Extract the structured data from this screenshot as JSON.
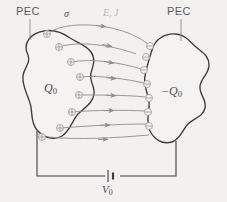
{
  "figure": {
    "kind": "physics-diagram",
    "background_color": "#f2f1ef",
    "ink_color": "#4a4a4a",
    "blob_fill": "#f4f3f1",
    "field_line_color": "#8e8c8a",
    "faded_label_color": "#b9b7b5"
  },
  "labels": {
    "pec_left": "PEC",
    "pec_right": "PEC",
    "charge_left": "Q",
    "charge_left_sub": "0",
    "charge_right": "−Q",
    "charge_right_sub": "0",
    "conductivity": "σ",
    "fields": "E, J",
    "voltage": "V",
    "voltage_sub": "0"
  },
  "symbols": {
    "positive_charge": "⊕",
    "negative_charge": "⊖",
    "battery": "battery-symbol"
  },
  "charges": {
    "positive_count": 8,
    "negative_count": 7
  },
  "field_lines": {
    "count": 7,
    "direction": "left-to-right",
    "arrowheads": true
  },
  "circuit": {
    "left_terminal_y": 138,
    "right_terminal_y": 140,
    "bottom_wire_y": 176,
    "battery_x": 112
  }
}
